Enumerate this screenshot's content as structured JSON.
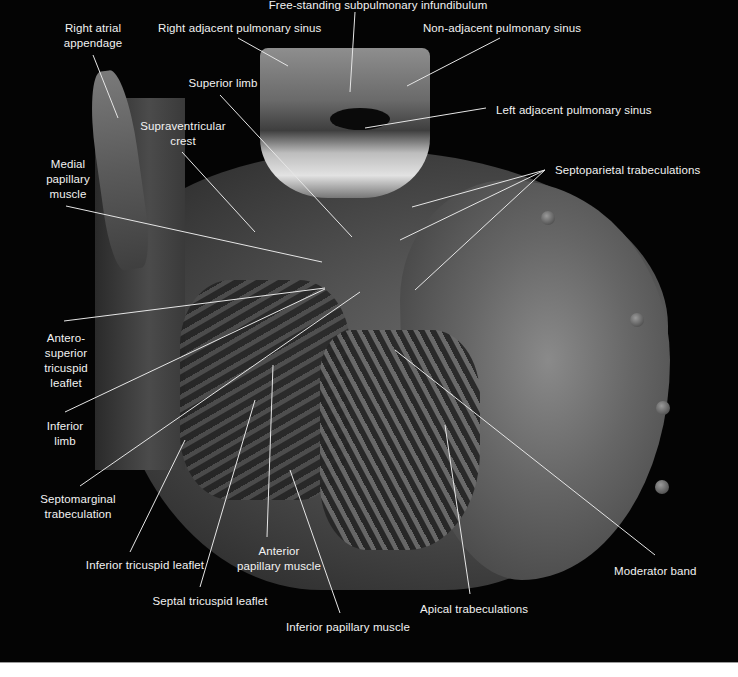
{
  "figure": {
    "background_color": "#040404",
    "label_color": "#f2f2f2",
    "line_color": "#e6e6e6"
  },
  "labels": [
    {
      "id": "free-standing-subpulmonary-infundibulum",
      "lines": [
        "Free-standing subpulmonary infundibulum"
      ],
      "x": 258,
      "y": -2,
      "w": 240,
      "align": "center",
      "pointer": [
        [
          355,
          12
        ],
        [
          350,
          92
        ]
      ]
    },
    {
      "id": "right-atrial-appendage",
      "lines": [
        "Right atrial",
        "appendage"
      ],
      "x": 58,
      "y": 21,
      "w": 70,
      "align": "center",
      "pointer": [
        [
          93,
          55
        ],
        [
          118,
          118
        ]
      ]
    },
    {
      "id": "right-adjacent-pulmonary-sinus",
      "lines": [
        "Right adjacent pulmonary sinus"
      ],
      "x": 158,
      "y": 21,
      "w": 160,
      "align": "center",
      "pointer": [
        [
          238,
          38
        ],
        [
          288,
          66
        ]
      ]
    },
    {
      "id": "non-adjacent-pulmonary-sinus",
      "lines": [
        "Non-adjacent pulmonary sinus"
      ],
      "x": 422,
      "y": 21,
      "w": 160,
      "align": "center",
      "pointer": [
        [
          500,
          38
        ],
        [
          407,
          86
        ]
      ]
    },
    {
      "id": "superior-limb",
      "lines": [
        "Superior limb"
      ],
      "x": 183,
      "y": 76,
      "w": 80,
      "align": "center",
      "pointer": [
        [
          220,
          95
        ],
        [
          352,
          237
        ]
      ]
    },
    {
      "id": "left-adjacent-pulmonary-sinus",
      "lines": [
        "Left adjacent pulmonary sinus"
      ],
      "x": 496,
      "y": 103,
      "w": 160,
      "align": "left",
      "pointer": [
        [
          486,
          108
        ],
        [
          365,
          128
        ]
      ]
    },
    {
      "id": "supraventricular-crest",
      "lines": [
        "Supraventricular",
        "crest"
      ],
      "x": 138,
      "y": 119,
      "w": 90,
      "align": "center",
      "pointer": [
        [
          182,
          152
        ],
        [
          255,
          232
        ]
      ]
    },
    {
      "id": "septoparietal-trabeculations",
      "lines": [
        "Septoparietal trabeculations"
      ],
      "x": 555,
      "y": 163,
      "w": 150,
      "align": "left",
      "pointer": [
        [
          545,
          170
        ],
        [
          412,
          207
        ]
      ],
      "extra_pointers": [
        [
          [
            545,
            170
          ],
          [
            400,
            240
          ]
        ],
        [
          [
            545,
            170
          ],
          [
            415,
            290
          ]
        ]
      ]
    },
    {
      "id": "medial-papillary-muscle",
      "lines": [
        "Medial",
        "papillary",
        "muscle"
      ],
      "x": 40,
      "y": 157,
      "w": 56,
      "align": "center",
      "pointer": [
        [
          66,
          206
        ],
        [
          322,
          262
        ]
      ]
    },
    {
      "id": "antero-superior-tricuspid-leaflet",
      "lines": [
        "Antero-",
        "superior",
        "tricuspid",
        "leaflet"
      ],
      "x": 38,
      "y": 331,
      "w": 56,
      "align": "center",
      "pointer": [
        [
          64,
          321
        ],
        [
          325,
          288
        ]
      ]
    },
    {
      "id": "inferior-limb",
      "lines": [
        "Inferior",
        "limb"
      ],
      "x": 40,
      "y": 419,
      "w": 50,
      "align": "center",
      "pointer": [
        [
          65,
          412
        ],
        [
          325,
          289
        ]
      ]
    },
    {
      "id": "septomarginal-trabeculation",
      "lines": [
        "Septomarginal",
        "trabeculation"
      ],
      "x": 38,
      "y": 492,
      "w": 80,
      "align": "center",
      "pointer": [
        [
          80,
          486
        ],
        [
          360,
          292
        ]
      ]
    },
    {
      "id": "inferior-tricuspid-leaflet",
      "lines": [
        "Inferior tricuspid leaflet"
      ],
      "x": 70,
      "y": 558,
      "w": 150,
      "align": "center",
      "pointer": [
        [
          130,
          552
        ],
        [
          185,
          440
        ]
      ]
    },
    {
      "id": "anterior-papillary-muscle",
      "lines": [
        "Anterior",
        "papillary muscle"
      ],
      "x": 224,
      "y": 544,
      "w": 110,
      "align": "center",
      "pointer": [
        [
          267,
          537
        ],
        [
          273,
          365
        ]
      ]
    },
    {
      "id": "septal-tricuspid-leaflet",
      "lines": [
        "Septal tricuspid leaflet"
      ],
      "x": 140,
      "y": 594,
      "w": 140,
      "align": "center",
      "pointer": [
        [
          200,
          587
        ],
        [
          255,
          400
        ]
      ]
    },
    {
      "id": "inferior-papillary-muscle",
      "lines": [
        "Inferior papillary muscle"
      ],
      "x": 278,
      "y": 620,
      "w": 140,
      "align": "center",
      "pointer": [
        [
          340,
          613
        ],
        [
          290,
          470
        ]
      ]
    },
    {
      "id": "apical-trabeculations",
      "lines": [
        "Apical trabeculations"
      ],
      "x": 420,
      "y": 602,
      "w": 110,
      "align": "left",
      "pointer": [
        [
          470,
          594
        ],
        [
          445,
          425
        ]
      ]
    },
    {
      "id": "moderator-band",
      "lines": [
        "Moderator band"
      ],
      "x": 614,
      "y": 564,
      "w": 90,
      "align": "left",
      "pointer": [
        [
          655,
          555
        ],
        [
          395,
          350
        ]
      ]
    }
  ],
  "beads": [
    {
      "x": 541,
      "y": 211
    },
    {
      "x": 630,
      "y": 313
    },
    {
      "x": 656,
      "y": 401
    },
    {
      "x": 655,
      "y": 480
    }
  ]
}
